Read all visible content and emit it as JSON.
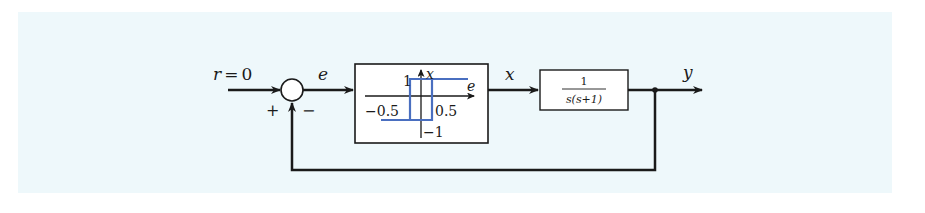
{
  "diagram": {
    "type": "feedback-control-block-diagram",
    "background_color": "#eef8fb",
    "line_color": "#1a1a1a",
    "curve_color": "#4a6fc0",
    "input": {
      "label": "r = 0",
      "var": "r",
      "eq": "=",
      "value": "0"
    },
    "summing_junction": {
      "plus_sign": "+",
      "minus_sign": "−"
    },
    "signals": {
      "error": "e",
      "intermediate": "x",
      "output": "y"
    },
    "nonlinearity_block": {
      "description": "relay with hysteresis",
      "x_axis_label": "e",
      "y_axis_label": "x",
      "top_level": "1",
      "bottom_level": "−1",
      "left_switch": "−0.5",
      "right_switch": "0.5"
    },
    "plant_block": {
      "numerator": "1",
      "denominator": "s(s+1)"
    },
    "feedback": "unity negative feedback"
  }
}
